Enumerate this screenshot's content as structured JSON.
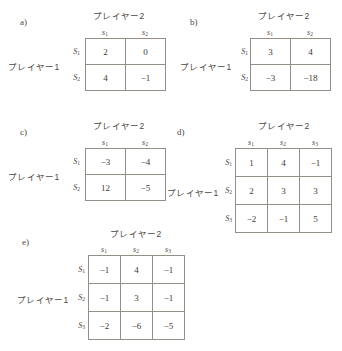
{
  "page": {
    "background_color": "#ffffff",
    "grid_line_color": "#938e86",
    "text_color": "#3d3a36"
  },
  "labels": {
    "player2": "プレイヤー2",
    "player1": "プレイヤー1",
    "col_s1": "s",
    "col_s2": "s",
    "col_s3": "s",
    "sub_1": "1",
    "sub_2": "2",
    "sub_3": "3",
    "row_S": "S"
  },
  "panels": [
    {
      "letter": "a)",
      "player2_label": "プレイヤー2",
      "player1_label": "プレイヤー1",
      "columns": [
        "s₁",
        "s₂"
      ],
      "rows": [
        "S₁",
        "S₂"
      ],
      "values": [
        [
          2,
          0
        ],
        [
          4,
          -1
        ]
      ],
      "cells": [
        [
          "2",
          "0"
        ],
        [
          "4",
          "−1"
        ]
      ]
    },
    {
      "letter": "b)",
      "player2_label": "プレイヤー2",
      "player1_label": "プレイヤー1",
      "columns": [
        "s₁",
        "s₂"
      ],
      "rows": [
        "S₁",
        "S₂"
      ],
      "values": [
        [
          3,
          4
        ],
        [
          -3,
          -18
        ]
      ],
      "cells": [
        [
          "3",
          "4"
        ],
        [
          "−3",
          "−18"
        ]
      ]
    },
    {
      "letter": "c)",
      "player2_label": "プレイヤー2",
      "player1_label": "プレイヤー1",
      "columns": [
        "s₁",
        "s₂"
      ],
      "rows": [
        "S₁",
        "S₂"
      ],
      "values": [
        [
          -3,
          -4
        ],
        [
          12,
          -5
        ]
      ],
      "cells": [
        [
          "−3",
          "−4"
        ],
        [
          "12",
          "−5"
        ]
      ]
    },
    {
      "letter": "d)",
      "player2_label": "プレイヤー2",
      "player1_label": "プレイヤー1",
      "columns": [
        "s₁",
        "s₂",
        "s₃"
      ],
      "rows": [
        "S₁",
        "S₂",
        "S₃"
      ],
      "values": [
        [
          1,
          4,
          -1
        ],
        [
          2,
          3,
          3
        ],
        [
          -2,
          -1,
          5
        ]
      ],
      "cells": [
        [
          "1",
          "4",
          "−1"
        ],
        [
          "2",
          "3",
          "3"
        ],
        [
          "−2",
          "−1",
          "5"
        ]
      ]
    },
    {
      "letter": "e)",
      "player2_label": "プレイヤー2",
      "player1_label": "プレイヤー1",
      "columns": [
        "s₁",
        "s₂",
        "s₃"
      ],
      "rows": [
        "S₁",
        "S₂",
        "S₃"
      ],
      "values": [
        [
          -1,
          4,
          -1
        ],
        [
          -1,
          3,
          -1
        ],
        [
          -2,
          -6,
          -5
        ]
      ],
      "cells": [
        [
          "−1",
          "4",
          "−1"
        ],
        [
          "−1",
          "3",
          "−1"
        ],
        [
          "−2",
          "−6",
          "−5"
        ]
      ]
    }
  ]
}
